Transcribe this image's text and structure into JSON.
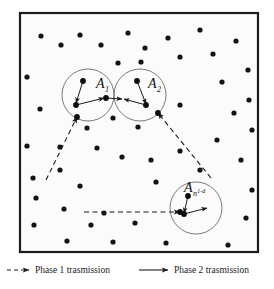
{
  "figure": {
    "title": "",
    "frame": {
      "x": 20,
      "y": 13,
      "width": 238,
      "height": 239,
      "border_color": "#1c1c1c",
      "fill_color": "#fbfbfb"
    },
    "node_color": "#141414",
    "node_radius": 2.6,
    "cluster_circle_color": "#5a5a5a",
    "arrow_color": "#1a1a1a",
    "clusters": [
      {
        "id": "A1",
        "label_base": "A",
        "label_sub": "1",
        "label_sup": "",
        "cx": 88,
        "cy": 95,
        "r": 26,
        "label_x": 96,
        "label_y": 88
      },
      {
        "id": "A2",
        "label_base": "A",
        "label_sub": "2",
        "label_sup": "",
        "cx": 140,
        "cy": 95,
        "r": 26,
        "label_x": 148,
        "label_y": 88
      },
      {
        "id": "An",
        "label_base": "A",
        "label_sub": "n",
        "label_sup": "1-d",
        "cx": 196,
        "cy": 208,
        "r": 26,
        "label_x": 184,
        "label_y": 192
      }
    ],
    "nodes": [
      {
        "x": 41,
        "y": 36
      },
      {
        "x": 61,
        "y": 45
      },
      {
        "x": 80,
        "y": 35
      },
      {
        "x": 101,
        "y": 45
      },
      {
        "x": 128,
        "y": 33
      },
      {
        "x": 145,
        "y": 48
      },
      {
        "x": 141,
        "y": 62
      },
      {
        "x": 168,
        "y": 38
      },
      {
        "x": 180,
        "y": 57
      },
      {
        "x": 200,
        "y": 30
      },
      {
        "x": 213,
        "y": 54
      },
      {
        "x": 236,
        "y": 41
      },
      {
        "x": 118,
        "y": 63
      },
      {
        "x": 27,
        "y": 77
      },
      {
        "x": 248,
        "y": 70
      },
      {
        "x": 222,
        "y": 82
      },
      {
        "x": 40,
        "y": 109
      },
      {
        "x": 113,
        "y": 118
      },
      {
        "x": 180,
        "y": 105
      },
      {
        "x": 234,
        "y": 113
      },
      {
        "x": 87,
        "y": 128
      },
      {
        "x": 138,
        "y": 127
      },
      {
        "x": 252,
        "y": 130
      },
      {
        "x": 27,
        "y": 146
      },
      {
        "x": 60,
        "y": 147
      },
      {
        "x": 97,
        "y": 148
      },
      {
        "x": 122,
        "y": 157
      },
      {
        "x": 151,
        "y": 160
      },
      {
        "x": 180,
        "y": 151
      },
      {
        "x": 200,
        "y": 170
      },
      {
        "x": 60,
        "y": 170
      },
      {
        "x": 33,
        "y": 178
      },
      {
        "x": 241,
        "y": 160
      },
      {
        "x": 80,
        "y": 186
      },
      {
        "x": 156,
        "y": 182
      },
      {
        "x": 252,
        "y": 190
      },
      {
        "x": 36,
        "y": 198
      },
      {
        "x": 64,
        "y": 209
      },
      {
        "x": 104,
        "y": 213
      },
      {
        "x": 135,
        "y": 223
      },
      {
        "x": 91,
        "y": 225
      },
      {
        "x": 246,
        "y": 218
      },
      {
        "x": 34,
        "y": 225
      },
      {
        "x": 67,
        "y": 241
      },
      {
        "x": 113,
        "y": 242
      },
      {
        "x": 166,
        "y": 243
      },
      {
        "x": 228,
        "y": 245
      },
      {
        "x": 249,
        "y": 100
      },
      {
        "x": 217,
        "y": 140
      }
    ],
    "phase1_arrows": [
      {
        "x1": 46,
        "y1": 180,
        "x2": 77,
        "y2": 117
      },
      {
        "x1": 211,
        "y1": 178,
        "x2": 158,
        "y2": 113
      },
      {
        "x1": 84,
        "y1": 212,
        "x2": 180,
        "y2": 212
      }
    ],
    "phase2_arrows": [
      {
        "x1": 83,
        "y1": 81,
        "x2": 76,
        "y2": 103
      },
      {
        "x1": 76,
        "y1": 105,
        "x2": 104,
        "y2": 98
      },
      {
        "x1": 106,
        "y1": 98,
        "x2": 122,
        "y2": 99
      },
      {
        "x1": 137,
        "y1": 81,
        "x2": 146,
        "y2": 104
      },
      {
        "x1": 146,
        "y1": 105,
        "x2": 124,
        "y2": 99
      },
      {
        "x1": 188,
        "y1": 196,
        "x2": 184,
        "y2": 213
      },
      {
        "x1": 184,
        "y1": 214,
        "x2": 207,
        "y2": 208
      }
    ],
    "legend": {
      "items": [
        {
          "id": "phase1",
          "style": "dashed",
          "label": "Phase 1 trasmission",
          "line_x1": 7,
          "line_x2": 29,
          "text_x": 35,
          "y": 273
        },
        {
          "id": "phase2",
          "style": "solid",
          "label": "Phase 2 trasmission",
          "line_x1": 139,
          "line_x2": 168,
          "text_x": 174,
          "y": 273
        }
      ]
    }
  }
}
